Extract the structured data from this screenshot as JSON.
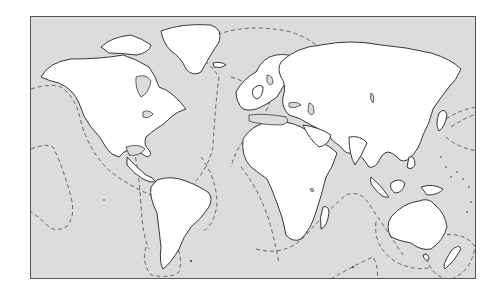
{
  "map": {
    "type": "world-outline",
    "projection": "cylindrical",
    "colors": {
      "ocean": "#dcdcdc",
      "land": "#ffffff",
      "coastline": "#222222",
      "dashed_boundaries": "#555555",
      "frame": "#555555"
    },
    "features": {
      "landmasses": [
        "North America",
        "Greenland",
        "South America",
        "Europe",
        "Africa",
        "Asia",
        "Australia",
        "New Zealand",
        "Antarctic islands",
        "Indonesia",
        "Madagascar",
        "Japan",
        "Philippines",
        "British Isles",
        "Iceland"
      ],
      "dashed_zones": [
        "North Pacific eastern boundary",
        "Eastern Pacific loop",
        "North Atlantic ridge",
        "South Atlantic Africa coast",
        "Indian Ocean ridge",
        "South Indian loop",
        "Australia-New Zealand loop",
        "Tasman loop",
        "North-west Pacific lines",
        "South America coast loop",
        "Cape Horn loop"
      ]
    },
    "labels": []
  }
}
